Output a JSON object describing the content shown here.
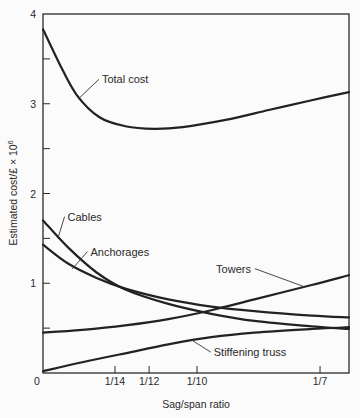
{
  "chart_data": {
    "type": "line",
    "title": "",
    "xlabel": "Sag/span ratio",
    "ylabel": "Estimated cost/£ × 10",
    "ylabel_sup": "6",
    "xlim": [
      0.0463,
      0.153
    ],
    "ylim": [
      0,
      4
    ],
    "grid": false,
    "legend": "inline annotations",
    "x_ticks": [
      {
        "value": 0.0714,
        "label": "1/14"
      },
      {
        "value": 0.0833,
        "label": "1/12"
      },
      {
        "value": 0.1,
        "label": "1/10"
      },
      {
        "value": 0.1429,
        "label": "1/7"
      }
    ],
    "x_origin_label": "0",
    "y_ticks": [
      {
        "value": 0,
        "label": "0"
      },
      {
        "value": 0.5,
        "label": ""
      },
      {
        "value": 1,
        "label": "1"
      },
      {
        "value": 1.5,
        "label": ""
      },
      {
        "value": 2,
        "label": "2"
      },
      {
        "value": 2.5,
        "label": ""
      },
      {
        "value": 3,
        "label": "3"
      },
      {
        "value": 3.5,
        "label": ""
      },
      {
        "value": 4,
        "label": "4"
      }
    ],
    "series": [
      {
        "name": "Total cost",
        "x": [
          0.0463,
          0.052,
          0.058,
          0.066,
          0.075,
          0.085,
          0.095,
          0.11,
          0.125,
          0.14,
          0.153
        ],
        "values": [
          3.83,
          3.45,
          3.1,
          2.85,
          2.75,
          2.72,
          2.74,
          2.82,
          2.93,
          3.04,
          3.13
        ],
        "label_at": {
          "x": 0.0585,
          "y": 3.05
        },
        "label_text_at": {
          "x": 0.0665,
          "y": 3.25
        }
      },
      {
        "name": "Cables",
        "x": [
          0.0463,
          0.055,
          0.065,
          0.075,
          0.09,
          0.105,
          0.12,
          0.14,
          0.153
        ],
        "values": [
          1.7,
          1.4,
          1.12,
          0.93,
          0.77,
          0.66,
          0.58,
          0.52,
          0.49
        ],
        "label_at": {
          "x": 0.0515,
          "y": 1.5
        },
        "label_text_at": {
          "x": 0.0545,
          "y": 1.72
        }
      },
      {
        "name": "Anchorages",
        "x": [
          0.0463,
          0.055,
          0.065,
          0.075,
          0.09,
          0.105,
          0.12,
          0.14,
          0.153
        ],
        "values": [
          1.43,
          1.22,
          1.06,
          0.94,
          0.82,
          0.74,
          0.69,
          0.64,
          0.62
        ],
        "label_at": {
          "x": 0.0565,
          "y": 1.16
        },
        "label_text_at": {
          "x": 0.0625,
          "y": 1.33
        }
      },
      {
        "name": "Towers",
        "x": [
          0.0463,
          0.06,
          0.075,
          0.09,
          0.105,
          0.12,
          0.14,
          0.153
        ],
        "values": [
          0.45,
          0.48,
          0.53,
          0.6,
          0.7,
          0.82,
          0.98,
          1.09
        ],
        "label_at": {
          "x": 0.1375,
          "y": 0.96
        },
        "label_text_at": {
          "x": 0.1195,
          "y": 1.14
        }
      },
      {
        "name": "Stiffening truss",
        "x": [
          0.0463,
          0.06,
          0.075,
          0.09,
          0.105,
          0.12,
          0.14,
          0.153
        ],
        "values": [
          0.02,
          0.12,
          0.22,
          0.32,
          0.4,
          0.45,
          0.49,
          0.51
        ],
        "label_at": {
          "x": 0.0985,
          "y": 0.36
        },
        "label_text_at": {
          "x": 0.1055,
          "y": 0.21
        }
      }
    ]
  }
}
